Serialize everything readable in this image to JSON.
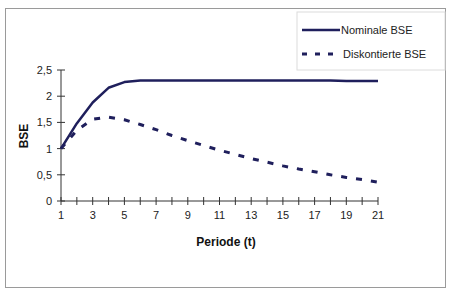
{
  "chart_data": {
    "type": "line",
    "title": "",
    "xlabel": "Periode (t)",
    "ylabel": "BSE",
    "x": [
      1,
      2,
      3,
      4,
      5,
      6,
      7,
      8,
      9,
      10,
      11,
      12,
      13,
      14,
      15,
      16,
      17,
      18,
      19,
      20,
      21
    ],
    "x_tick_labels": [
      "1",
      "3",
      "5",
      "7",
      "9",
      "11",
      "13",
      "15",
      "17",
      "19",
      "21"
    ],
    "y_tick_labels": [
      "0",
      "0,5",
      "1",
      "1,5",
      "2",
      "2,5"
    ],
    "ylim": [
      0,
      2.5
    ],
    "xlim": [
      1,
      21
    ],
    "grid": false,
    "legend_position": "top-right",
    "series": [
      {
        "name": "Nominale BSE",
        "style": "solid",
        "color": "#1f1f5c",
        "values": [
          1.0,
          1.48,
          1.88,
          2.16,
          2.27,
          2.3,
          2.3,
          2.3,
          2.3,
          2.3,
          2.3,
          2.3,
          2.3,
          2.3,
          2.3,
          2.3,
          2.3,
          2.3,
          2.29,
          2.29,
          2.29
        ]
      },
      {
        "name": "Diskontierte BSE",
        "style": "dashed",
        "color": "#1f1f5c",
        "values": [
          1.0,
          1.35,
          1.56,
          1.6,
          1.55,
          1.46,
          1.36,
          1.25,
          1.15,
          1.06,
          0.97,
          0.89,
          0.81,
          0.74,
          0.67,
          0.61,
          0.56,
          0.5,
          0.45,
          0.41,
          0.36
        ]
      }
    ]
  },
  "legend": {
    "items": [
      {
        "label": "Nominale BSE"
      },
      {
        "label": "Diskontierte BSE"
      }
    ]
  }
}
